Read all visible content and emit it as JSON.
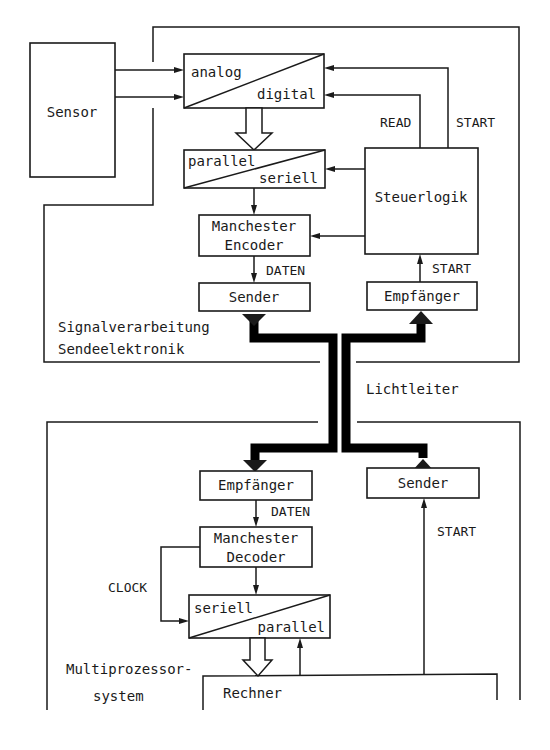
{
  "diagram": {
    "transmitter_section": {
      "label_line1": "Signalverarbeitung",
      "label_line2": "Sendeelektronik",
      "blocks": {
        "sensor": "Sensor",
        "adc_top": "analog",
        "adc_bottom": "digital",
        "p2s_top": "parallel",
        "p2s_bottom": "seriell",
        "encoder_line1": "Manchester",
        "encoder_line2": "Encoder",
        "sender": "Sender",
        "control_logic": "Steuerlogik",
        "receiver": "Empfänger"
      },
      "signals": {
        "read": "READ",
        "start_top": "START",
        "data": "DATEN",
        "start_receiver": "START"
      }
    },
    "fiber_label": "Lichtleiter",
    "receiver_section": {
      "label_line1": "Multiprozessor-",
      "label_line2": "system",
      "blocks": {
        "receiver": "Empfänger",
        "decoder_line1": "Manchester",
        "decoder_line2": "Decoder",
        "s2p_top": "seriell",
        "s2p_bottom": "parallel",
        "sender": "Sender",
        "computer": "Rechner"
      },
      "signals": {
        "data": "DATEN",
        "clock": "CLOCK",
        "start": "START"
      }
    }
  }
}
